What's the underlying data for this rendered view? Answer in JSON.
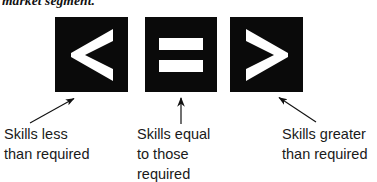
{
  "figure": {
    "top_fragment_text": "market segment.",
    "background_color": "#ffffff",
    "tile_color": "#0a0a0a",
    "glyph_color": "#ffffff",
    "text_color": "#1a1a1a"
  },
  "items": [
    {
      "symbol": "<",
      "icon_name": "less-than-chevron-icon",
      "caption_lines": [
        "Skills less",
        "than required"
      ],
      "arrow": {
        "name": "arrow-up-right",
        "from_x": 30,
        "from_y": 123,
        "to_x": 76,
        "to_y": 97
      }
    },
    {
      "symbol": "=",
      "icon_name": "equals-bars-icon",
      "caption_lines": [
        "Skills equal",
        "to those",
        "required"
      ],
      "arrow": {
        "name": "arrow-up",
        "from_x": 181,
        "from_y": 124,
        "to_x": 181,
        "to_y": 96
      }
    },
    {
      "symbol": ">",
      "icon_name": "greater-than-chevron-icon",
      "caption_lines": [
        "Skills greater",
        "than required"
      ],
      "arrow": {
        "name": "arrow-up-left",
        "from_x": 316,
        "from_y": 122,
        "to_x": 277,
        "to_y": 96
      }
    }
  ]
}
